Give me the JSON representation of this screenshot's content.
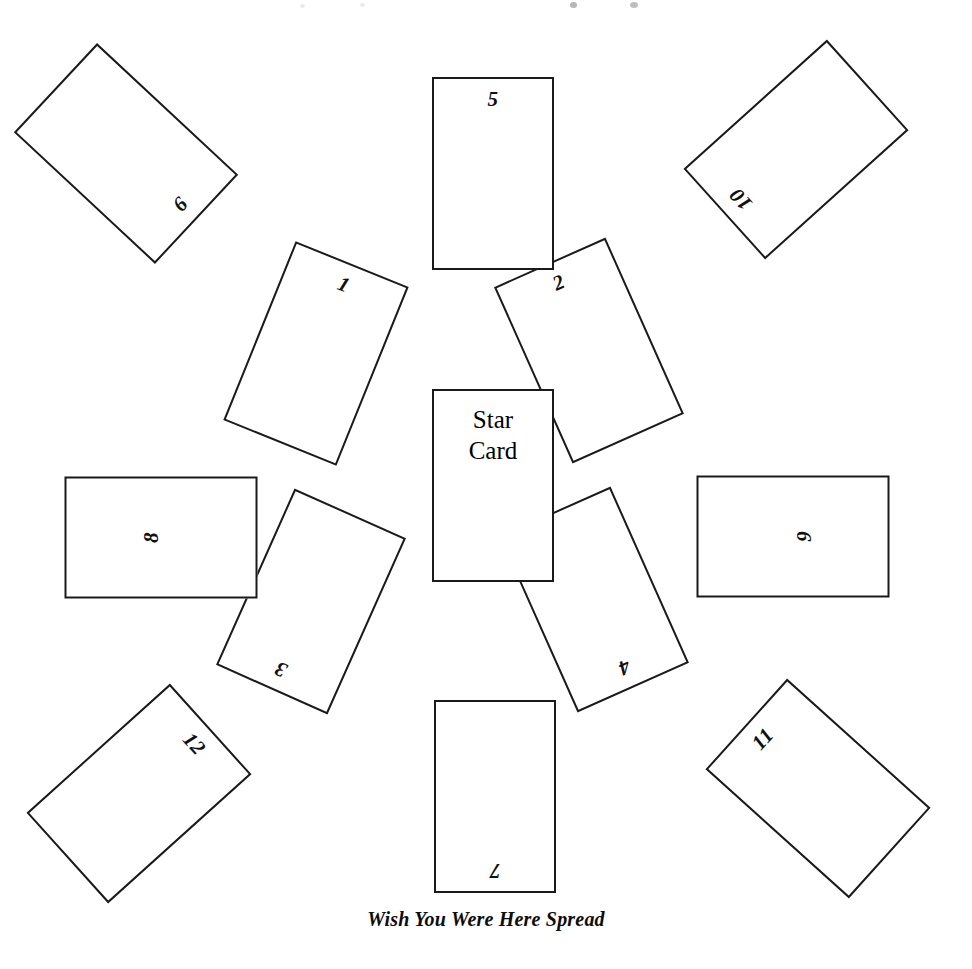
{
  "diagram": {
    "caption": "Wish You Were Here Spread",
    "center_card": {
      "line1": "Star",
      "line2": "Card"
    },
    "card_size": {
      "width": 122,
      "height": 193
    },
    "colors": {
      "background": "#ffffff",
      "card_border": "#1a1a1a",
      "text": "#000000"
    },
    "cards": [
      {
        "number": "1",
        "left": 255,
        "top": 257,
        "rotation": 22,
        "orientation": "portrait"
      },
      {
        "number": "2",
        "left": 528,
        "top": 254,
        "rotation": -24,
        "orientation": "portrait"
      },
      {
        "number": "3",
        "left": 250,
        "top": 505,
        "rotation": 204,
        "orientation": "portrait"
      },
      {
        "number": "4",
        "left": 533,
        "top": 503,
        "rotation": 156,
        "orientation": "portrait"
      },
      {
        "number": "5",
        "left": 432,
        "top": 77,
        "rotation": 0,
        "orientation": "portrait"
      },
      {
        "number": "6",
        "left": 732,
        "top": 440,
        "rotation": 90,
        "orientation": "landscape"
      },
      {
        "number": "7",
        "left": 434,
        "top": 700,
        "rotation": 180,
        "orientation": "portrait"
      },
      {
        "number": "8",
        "left": 100,
        "top": 441,
        "rotation": -90,
        "orientation": "landscape"
      },
      {
        "number": "9",
        "left": 65,
        "top": 57,
        "rotation": 133,
        "orientation": "portrait"
      },
      {
        "number": "10",
        "left": 735,
        "top": 53,
        "rotation": -132,
        "orientation": "portrait"
      },
      {
        "number": "11",
        "left": 757,
        "top": 692,
        "rotation": -48,
        "orientation": "portrait"
      },
      {
        "number": "12",
        "left": 78,
        "top": 697,
        "rotation": 48,
        "orientation": "portrait"
      }
    ]
  }
}
